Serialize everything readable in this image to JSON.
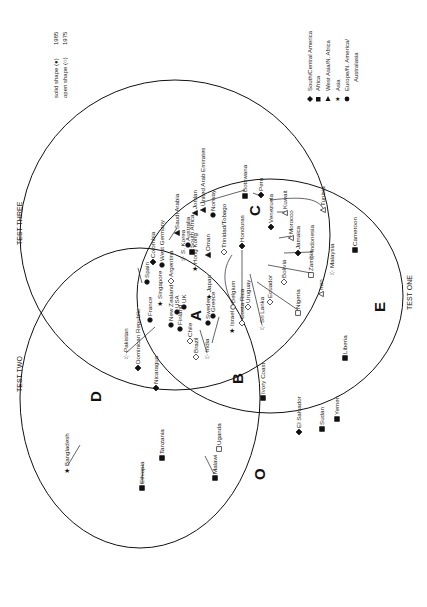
{
  "legend_shape": {
    "solid": {
      "label": "solid shape (●)",
      "year": "1985"
    },
    "open": {
      "label": "open shape (○)",
      "year": "1975"
    }
  },
  "legend_regions": [
    {
      "symbol": "diamond",
      "glyph": "◆",
      "label": "South/Central America"
    },
    {
      "symbol": "square",
      "glyph": "■",
      "label": "Africa"
    },
    {
      "symbol": "triangle",
      "glyph": "▲",
      "label": "West Asia/N. Africa"
    },
    {
      "symbol": "star",
      "glyph": "★",
      "label": "Asia"
    },
    {
      "symbol": "circle",
      "glyph": "●",
      "label": "Europe/N. America/"
    },
    {
      "symbol": "",
      "glyph": "",
      "label": "Australasia"
    }
  ],
  "tests": {
    "one": "TEST ONE",
    "two": "TEST TWO",
    "three": "TEST THREE"
  },
  "regions": {
    "A": "A",
    "B": "B",
    "C": "C",
    "D": "D",
    "E": "E",
    "O": "O"
  },
  "countries": [
    {
      "name": "Spain",
      "x": 147,
      "y": 282,
      "shape": "circle",
      "fill": "solid"
    },
    {
      "name": "France",
      "x": 150,
      "y": 320,
      "shape": "circle",
      "fill": "solid"
    },
    {
      "name": "Colombia",
      "x": 153,
      "y": 262,
      "shape": "diamond",
      "fill": "solid"
    },
    {
      "name": "Singapore",
      "x": 160,
      "y": 303,
      "shape": "star",
      "fill": "solid"
    },
    {
      "name": "West Germany",
      "x": 162,
      "y": 265,
      "shape": "circle",
      "fill": "solid"
    },
    {
      "name": "Argentina",
      "x": 171,
      "y": 281,
      "shape": "diamond",
      "fill": "open"
    },
    {
      "name": "New Zealand",
      "x": 171,
      "y": 325,
      "shape": "circle",
      "fill": "solid"
    },
    {
      "name": "USA",
      "x": 177,
      "y": 312,
      "shape": "circle",
      "fill": "solid"
    },
    {
      "name": "Finland",
      "x": 180,
      "y": 329,
      "shape": "circle",
      "fill": "solid"
    },
    {
      "name": "UK",
      "x": 184,
      "y": 307,
      "shape": "circle",
      "fill": "solid"
    },
    {
      "name": "S. Korea",
      "x": 183,
      "y": 258,
      "shape": "star",
      "fill": "open"
    },
    {
      "name": "Hong Kong",
      "x": 195,
      "y": 268,
      "shape": "star",
      "fill": "solid"
    },
    {
      "name": "Chile",
      "x": 190,
      "y": 341,
      "shape": "diamond",
      "fill": "open"
    },
    {
      "name": "Sweden",
      "x": 208,
      "y": 323,
      "shape": "circle",
      "fill": "solid"
    },
    {
      "name": "Japan",
      "x": 209,
      "y": 296,
      "shape": "star",
      "fill": "solid"
    },
    {
      "name": "Greece",
      "x": 213,
      "y": 316,
      "shape": "circle",
      "fill": "solid"
    },
    {
      "name": "Belgium",
      "x": 233,
      "y": 307,
      "shape": "circle",
      "fill": "open"
    },
    {
      "name": "Israel",
      "x": 232,
      "y": 330,
      "shape": "star",
      "fill": "solid"
    },
    {
      "name": "Costa Rica",
      "x": 242,
      "y": 323,
      "shape": "diamond",
      "fill": "open"
    },
    {
      "name": "Uruguay",
      "x": 248,
      "y": 307,
      "shape": "diamond",
      "fill": "open"
    },
    {
      "name": "Sri Lanka",
      "x": 262,
      "y": 327,
      "shape": "star",
      "fill": "open"
    },
    {
      "name": "Ecuador",
      "x": 270,
      "y": 302,
      "shape": "diamond",
      "fill": "open"
    },
    {
      "name": "Brazil",
      "x": 196,
      "y": 357,
      "shape": "diamond",
      "fill": "open"
    },
    {
      "name": "India",
      "x": 207,
      "y": 356,
      "shape": "star",
      "fill": "open"
    },
    {
      "name": "Saudi Arabia",
      "x": 177,
      "y": 233,
      "shape": "triangle",
      "fill": "solid"
    },
    {
      "name": "Australia",
      "x": 188,
      "y": 245,
      "shape": "circle",
      "fill": "solid"
    },
    {
      "name": "South Africa",
      "x": 192,
      "y": 252,
      "shape": "square",
      "fill": "solid"
    },
    {
      "name": "Jordan",
      "x": 195,
      "y": 213,
      "shape": "triangle",
      "fill": "solid"
    },
    {
      "name": "United Arab Emirates",
      "x": 203,
      "y": 210,
      "shape": "triangle",
      "fill": "solid"
    },
    {
      "name": "Oman",
      "x": 208,
      "y": 255,
      "shape": "triangle",
      "fill": "solid"
    },
    {
      "name": "Norway",
      "x": 213,
      "y": 215,
      "shape": "circle",
      "fill": "solid"
    },
    {
      "name": "Trinidad/Tobago",
      "x": 224,
      "y": 252,
      "shape": "diamond",
      "fill": "open"
    },
    {
      "name": "Honduras",
      "x": 242,
      "y": 246,
      "shape": "diamond",
      "fill": "solid"
    },
    {
      "name": "Botswana",
      "x": 245,
      "y": 196,
      "shape": "square",
      "fill": "solid"
    },
    {
      "name": "Peru",
      "x": 261,
      "y": 195,
      "shape": "diamond",
      "fill": "solid"
    },
    {
      "name": "Venezuela",
      "x": 271,
      "y": 227,
      "shape": "diamond",
      "fill": "solid"
    },
    {
      "name": "Kuwait",
      "x": 285,
      "y": 213,
      "shape": "triangle",
      "fill": "open"
    },
    {
      "name": "Morocco",
      "x": 291,
      "y": 238,
      "shape": "triangle",
      "fill": "open"
    },
    {
      "name": "Jamaica",
      "x": 298,
      "y": 253,
      "shape": "diamond",
      "fill": "solid"
    },
    {
      "name": "Indonesia",
      "x": 312,
      "y": 256,
      "shape": "star",
      "fill": "open"
    },
    {
      "name": "Tunisia",
      "x": 323,
      "y": 210,
      "shape": "triangle",
      "fill": "open"
    },
    {
      "name": "Bolivia",
      "x": 284,
      "y": 282,
      "shape": "diamond",
      "fill": "open"
    },
    {
      "name": "Zambia",
      "x": 311,
      "y": 275,
      "shape": "square",
      "fill": "open"
    },
    {
      "name": "Iran",
      "x": 321,
      "y": 294,
      "shape": "triangle",
      "fill": "open"
    },
    {
      "name": "Malaysia",
      "x": 332,
      "y": 272,
      "shape": "star",
      "fill": "open"
    },
    {
      "name": "Nigeria",
      "x": 298,
      "y": 313,
      "shape": "square",
      "fill": "open"
    },
    {
      "name": "Cameroon",
      "x": 355,
      "y": 250,
      "shape": "square",
      "fill": "solid"
    },
    {
      "name": "Liberia",
      "x": 345,
      "y": 358,
      "shape": "square",
      "fill": "solid"
    },
    {
      "name": "Ivory Coast",
      "x": 263,
      "y": 398,
      "shape": "square",
      "fill": "solid"
    },
    {
      "name": "Pakistan",
      "x": 126,
      "y": 356,
      "shape": "star",
      "fill": "open"
    },
    {
      "name": "Dominican Republic",
      "x": 138,
      "y": 368,
      "shape": "diamond",
      "fill": "solid"
    },
    {
      "name": "Nicaragua",
      "x": 156,
      "y": 388,
      "shape": "diamond",
      "fill": "solid"
    },
    {
      "name": "Tanzania",
      "x": 162,
      "y": 458,
      "shape": "square",
      "fill": "solid"
    },
    {
      "name": "Uganda",
      "x": 219,
      "y": 449,
      "shape": "square",
      "fill": "open"
    },
    {
      "name": "Bangladesh",
      "x": 67,
      "y": 470,
      "shape": "star",
      "fill": "solid"
    },
    {
      "name": "Ethiopia",
      "x": 142,
      "y": 488,
      "shape": "square",
      "fill": "solid"
    },
    {
      "name": "Malawi",
      "x": 215,
      "y": 478,
      "shape": "square",
      "fill": "solid"
    },
    {
      "name": "El Salvador",
      "x": 299,
      "y": 432,
      "shape": "diamond",
      "fill": "solid"
    },
    {
      "name": "Sudan",
      "x": 322,
      "y": 429,
      "shape": "square",
      "fill": "solid"
    },
    {
      "name": "Yemen",
      "x": 337,
      "y": 419,
      "shape": "square",
      "fill": "solid"
    }
  ]
}
